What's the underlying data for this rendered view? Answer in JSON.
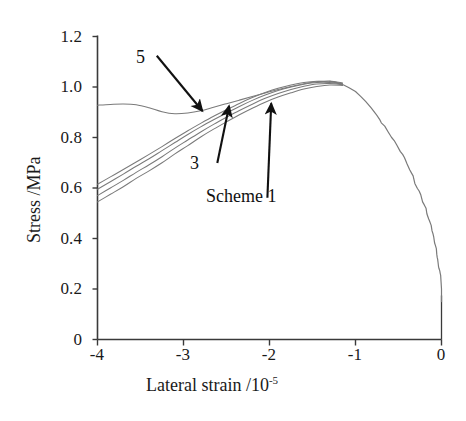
{
  "chart_data": {
    "type": "line",
    "title": "",
    "xlabel": "Lateral strain /10-5",
    "xlabel_base": "Lateral strain /10",
    "xlabel_exponent": "-5",
    "ylabel": "Stress /MPa",
    "xlim": [
      -4,
      0
    ],
    "ylim": [
      0,
      1.2
    ],
    "xticks": [
      "-4",
      "-3",
      "-2",
      "-1",
      "0"
    ],
    "xtick_values": [
      -4,
      -3,
      -2,
      -1,
      0
    ],
    "yticks": [
      "0",
      "0.2",
      "0.4",
      "0.6",
      "0.8",
      "1.0",
      "1.2"
    ],
    "ytick_values": [
      0,
      0.2,
      0.4,
      0.6,
      0.8,
      1.0,
      1.2
    ],
    "grid": false,
    "legend": "none",
    "line_color": "#7a7a7a",
    "axis_color": "#3a3a3a",
    "annotations": [
      {
        "name": "scheme-5-label",
        "text": "5",
        "x": -3.45,
        "y": 1.1,
        "arrow_to_x": -2.78,
        "arrow_to_y": 0.905
      },
      {
        "name": "scheme-3-label",
        "text": "3",
        "x": -2.7,
        "y": 0.715,
        "arrow_to_x": -2.47,
        "arrow_to_y": 0.925
      },
      {
        "name": "scheme-1-label",
        "text": "Scheme 1",
        "x": -2.35,
        "y": 0.585,
        "arrow_to_x": -1.98,
        "arrow_to_y": 0.935
      }
    ],
    "series": [
      {
        "name": "Scheme 1",
        "points": [
          [
            -4.0,
            0.545
          ],
          [
            -3.85,
            0.575
          ],
          [
            -3.7,
            0.605
          ],
          [
            -3.55,
            0.638
          ],
          [
            -3.4,
            0.668
          ],
          [
            -3.25,
            0.7
          ],
          [
            -3.1,
            0.735
          ],
          [
            -2.95,
            0.768
          ],
          [
            -2.8,
            0.802
          ],
          [
            -2.65,
            0.833
          ],
          [
            -2.5,
            0.862
          ],
          [
            -2.35,
            0.89
          ],
          [
            -2.2,
            0.916
          ],
          [
            -2.05,
            0.94
          ],
          [
            -1.9,
            0.96
          ],
          [
            -1.75,
            0.977
          ],
          [
            -1.6,
            0.992
          ],
          [
            -1.45,
            1.002
          ],
          [
            -1.3,
            1.008
          ],
          [
            -1.15,
            1.006
          ]
        ]
      },
      {
        "name": "Scheme 2",
        "points": [
          [
            -4.0,
            0.57
          ],
          [
            -3.85,
            0.6
          ],
          [
            -3.7,
            0.63
          ],
          [
            -3.55,
            0.662
          ],
          [
            -3.4,
            0.692
          ],
          [
            -3.25,
            0.724
          ],
          [
            -3.1,
            0.758
          ],
          [
            -2.95,
            0.79
          ],
          [
            -2.8,
            0.822
          ],
          [
            -2.65,
            0.852
          ],
          [
            -2.5,
            0.88
          ],
          [
            -2.35,
            0.907
          ],
          [
            -2.2,
            0.932
          ],
          [
            -2.05,
            0.955
          ],
          [
            -1.9,
            0.974
          ],
          [
            -1.75,
            0.99
          ],
          [
            -1.6,
            1.003
          ],
          [
            -1.45,
            1.012
          ],
          [
            -1.3,
            1.014
          ],
          [
            -1.15,
            1.009
          ]
        ]
      },
      {
        "name": "Scheme 3",
        "points": [
          [
            -4.0,
            0.595
          ],
          [
            -3.85,
            0.625
          ],
          [
            -3.7,
            0.655
          ],
          [
            -3.55,
            0.686
          ],
          [
            -3.4,
            0.716
          ],
          [
            -3.25,
            0.748
          ],
          [
            -3.1,
            0.78
          ],
          [
            -2.95,
            0.812
          ],
          [
            -2.8,
            0.842
          ],
          [
            -2.65,
            0.87
          ],
          [
            -2.5,
            0.897
          ],
          [
            -2.35,
            0.923
          ],
          [
            -2.2,
            0.947
          ],
          [
            -2.05,
            0.968
          ],
          [
            -1.9,
            0.986
          ],
          [
            -1.75,
            1.0
          ],
          [
            -1.6,
            1.011
          ],
          [
            -1.45,
            1.018
          ],
          [
            -1.3,
            1.018
          ],
          [
            -1.15,
            1.011
          ]
        ]
      },
      {
        "name": "Scheme 4",
        "points": [
          [
            -4.0,
            0.615
          ],
          [
            -3.85,
            0.644
          ],
          [
            -3.7,
            0.673
          ],
          [
            -3.55,
            0.703
          ],
          [
            -3.4,
            0.733
          ],
          [
            -3.25,
            0.764
          ],
          [
            -3.1,
            0.796
          ],
          [
            -2.95,
            0.827
          ],
          [
            -2.8,
            0.856
          ],
          [
            -2.65,
            0.884
          ],
          [
            -2.5,
            0.91
          ],
          [
            -2.35,
            0.935
          ],
          [
            -2.2,
            0.958
          ],
          [
            -2.05,
            0.978
          ],
          [
            -1.9,
            0.995
          ],
          [
            -1.75,
            1.008
          ],
          [
            -1.6,
            1.018
          ],
          [
            -1.45,
            1.023
          ],
          [
            -1.3,
            1.021
          ],
          [
            -1.15,
            1.013
          ]
        ]
      },
      {
        "name": "Scheme 5",
        "points": [
          [
            -4.0,
            0.928
          ],
          [
            -3.85,
            0.931
          ],
          [
            -3.7,
            0.933
          ],
          [
            -3.55,
            0.93
          ],
          [
            -3.4,
            0.918
          ],
          [
            -3.25,
            0.902
          ],
          [
            -3.1,
            0.894
          ],
          [
            -2.95,
            0.897
          ],
          [
            -2.8,
            0.906
          ],
          [
            -2.65,
            0.92
          ],
          [
            -2.5,
            0.934
          ],
          [
            -2.35,
            0.948
          ],
          [
            -2.2,
            0.962
          ],
          [
            -2.05,
            0.976
          ],
          [
            -1.9,
            0.99
          ],
          [
            -1.75,
            1.002
          ],
          [
            -1.6,
            1.013
          ],
          [
            -1.45,
            1.021
          ],
          [
            -1.3,
            1.024
          ],
          [
            -1.15,
            1.016
          ]
        ]
      },
      {
        "name": "Common descending branch",
        "points": [
          [
            -1.3,
            1.022
          ],
          [
            -1.22,
            1.018
          ],
          [
            -1.15,
            1.01
          ],
          [
            -1.08,
            0.998
          ],
          [
            -1.0,
            0.982
          ],
          [
            -0.94,
            0.963
          ],
          [
            -0.88,
            0.942
          ],
          [
            -0.82,
            0.918
          ],
          [
            -0.76,
            0.892
          ],
          [
            -0.72,
            0.872
          ],
          [
            -0.7,
            0.858
          ],
          [
            -0.66,
            0.845
          ],
          [
            -0.62,
            0.822
          ],
          [
            -0.58,
            0.8
          ],
          [
            -0.55,
            0.788
          ],
          [
            -0.52,
            0.77
          ],
          [
            -0.48,
            0.745
          ],
          [
            -0.45,
            0.732
          ],
          [
            -0.43,
            0.72
          ],
          [
            -0.4,
            0.695
          ],
          [
            -0.37,
            0.672
          ],
          [
            -0.35,
            0.66
          ],
          [
            -0.33,
            0.648
          ],
          [
            -0.31,
            0.618
          ],
          [
            -0.28,
            0.598
          ],
          [
            -0.26,
            0.588
          ],
          [
            -0.24,
            0.572
          ],
          [
            -0.22,
            0.545
          ],
          [
            -0.2,
            0.533
          ],
          [
            -0.18,
            0.52
          ],
          [
            -0.17,
            0.498
          ],
          [
            -0.15,
            0.478
          ],
          [
            -0.14,
            0.47
          ],
          [
            -0.12,
            0.452
          ],
          [
            -0.11,
            0.43
          ],
          [
            -0.1,
            0.42
          ],
          [
            -0.09,
            0.405
          ],
          [
            -0.08,
            0.382
          ],
          [
            -0.07,
            0.372
          ],
          [
            -0.06,
            0.36
          ],
          [
            -0.055,
            0.338
          ],
          [
            -0.05,
            0.325
          ],
          [
            -0.045,
            0.318
          ],
          [
            -0.04,
            0.305
          ],
          [
            -0.035,
            0.29
          ],
          [
            -0.03,
            0.282
          ],
          [
            -0.02,
            0.272
          ],
          [
            -0.015,
            0.262
          ],
          [
            -0.01,
            0.255
          ],
          [
            -0.005,
            0.228
          ],
          [
            0.0,
            0.2
          ]
        ]
      }
    ]
  },
  "axes": {
    "y_title": "Stress /MPa",
    "x_title_base": "Lateral strain /10",
    "x_title_exp": "-5"
  }
}
